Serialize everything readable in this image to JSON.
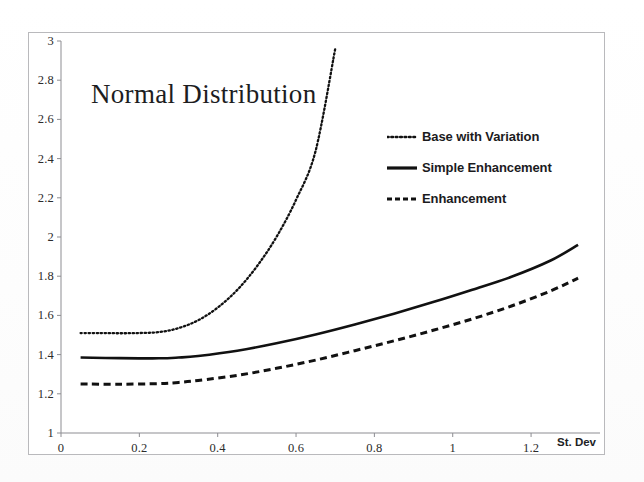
{
  "chart_data": {
    "type": "line",
    "title": "Normal Distribution",
    "xlabel": "St. Dev",
    "ylabel": "",
    "xlim": [
      0,
      1.33
    ],
    "ylim": [
      1,
      3
    ],
    "grid": false,
    "legend_position": "upper-right",
    "xticks": [
      "0",
      "0.2",
      "0.4",
      "0.6",
      "0.8",
      "1",
      "1.2"
    ],
    "xtick_values": [
      0,
      0.2,
      0.4,
      0.6,
      0.8,
      1.0,
      1.2
    ],
    "yticks": [
      "1",
      "1.2",
      "1.4",
      "1.6",
      "1.8",
      "2",
      "2.2",
      "2.4",
      "2.6",
      "2.8",
      "3"
    ],
    "ytick_values": [
      1,
      1.2,
      1.4,
      1.6,
      1.8,
      2.0,
      2.2,
      2.4,
      2.6,
      2.8,
      3.0
    ],
    "series": [
      {
        "name": "Base with Variation",
        "style": "dotted",
        "color": "#111111",
        "x": [
          0.05,
          0.1,
          0.15,
          0.2,
          0.25,
          0.3,
          0.35,
          0.4,
          0.45,
          0.5,
          0.55,
          0.6,
          0.65,
          0.7
        ],
        "values": [
          1.51,
          1.51,
          1.509,
          1.51,
          1.515,
          1.535,
          1.575,
          1.64,
          1.73,
          1.85,
          2.0,
          2.19,
          2.44,
          2.96
        ]
      },
      {
        "name": "Simple Enhancement",
        "style": "solid",
        "color": "#111111",
        "x": [
          0.05,
          0.15,
          0.25,
          0.3,
          0.35,
          0.45,
          0.55,
          0.65,
          0.75,
          0.85,
          0.95,
          1.05,
          1.15,
          1.25,
          1.32
        ],
        "values": [
          1.385,
          1.382,
          1.381,
          1.385,
          1.393,
          1.42,
          1.458,
          1.503,
          1.554,
          1.609,
          1.668,
          1.731,
          1.797,
          1.88,
          1.96
        ]
      },
      {
        "name": "Enhancement",
        "style": "dashed",
        "color": "#111111",
        "x": [
          0.05,
          0.15,
          0.25,
          0.3,
          0.35,
          0.45,
          0.55,
          0.65,
          0.75,
          0.85,
          0.95,
          1.05,
          1.15,
          1.25,
          1.32
        ],
        "values": [
          1.25,
          1.249,
          1.252,
          1.258,
          1.268,
          1.294,
          1.33,
          1.372,
          1.42,
          1.47,
          1.524,
          1.582,
          1.648,
          1.725,
          1.79
        ]
      }
    ]
  },
  "legend": {
    "items": [
      {
        "label": "Base with Variation",
        "style": "dotted"
      },
      {
        "label": "Simple Enhancement",
        "style": "solid"
      },
      {
        "label": "Enhancement",
        "style": "dashed"
      }
    ]
  }
}
